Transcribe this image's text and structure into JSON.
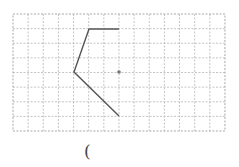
{
  "grid": {
    "x0": 13,
    "y0": 14,
    "cols": 14,
    "rows": 8,
    "cell_w": 15.14,
    "cell_h": 14.625,
    "line_color": "#b5b5b5",
    "border_color": "#a8a8a8"
  },
  "figure": {
    "polyline_points": [
      [
        119,
        29
      ],
      [
        89,
        29
      ],
      [
        74,
        72
      ],
      [
        119,
        116
      ]
    ],
    "stroke_color": "#555555",
    "center_dot": {
      "x": 119,
      "y": 72,
      "r": 1.8,
      "color": "#777777"
    }
  },
  "answer": {
    "paren_text": "("
  }
}
